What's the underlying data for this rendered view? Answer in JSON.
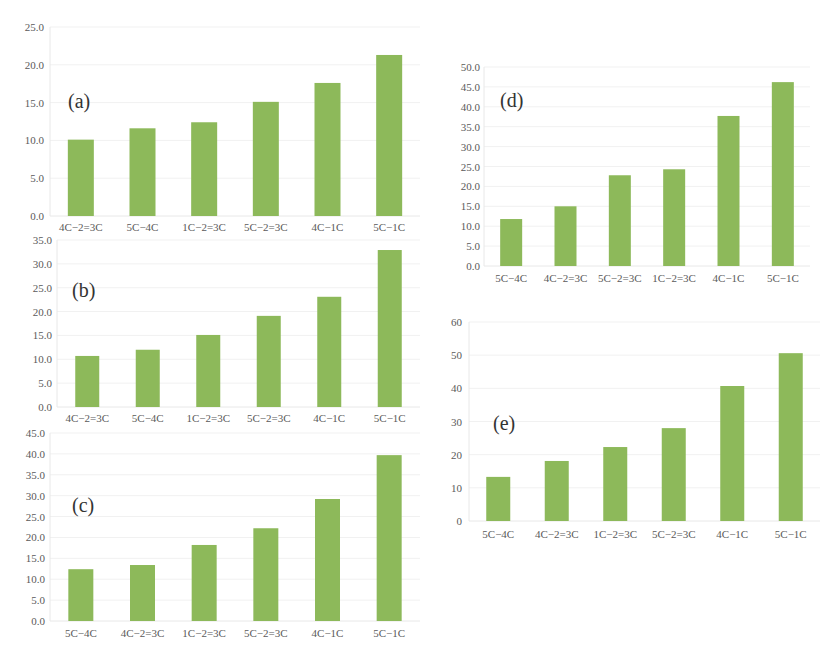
{
  "colors": {
    "bar": "#8db95a",
    "text": "#5a5a5a",
    "grid": "#f1f1f1"
  },
  "chart_data": [
    {
      "id": "a",
      "panel_label": "(a)",
      "type": "bar",
      "title": "",
      "xlabel": "",
      "ylabel": "",
      "categories": [
        "4C-2=3C",
        "5C-4C",
        "1C-2=3C",
        "5C-2=3C",
        "4C-1C",
        "5C-1C"
      ],
      "values": [
        10.1,
        11.6,
        12.4,
        15.1,
        17.6,
        21.3
      ],
      "ylim": [
        0,
        25
      ],
      "yticks": [
        "0.0",
        "5.0",
        "10.0",
        "15.0",
        "20.0",
        "25.0"
      ],
      "ytick_values": [
        0,
        5,
        10,
        15,
        20,
        25
      ],
      "grid": true,
      "legend": null
    },
    {
      "id": "b",
      "panel_label": "(b)",
      "type": "bar",
      "title": "",
      "xlabel": "",
      "ylabel": "",
      "categories": [
        "4C-2=3C",
        "5C-4C",
        "1C-2=3C",
        "5C-2=3C",
        "4C-1C",
        "5C-1C"
      ],
      "values": [
        10.7,
        12.0,
        15.1,
        19.1,
        23.1,
        32.9
      ],
      "ylim": [
        0,
        35
      ],
      "yticks": [
        "0.0",
        "5.0",
        "10.0",
        "15.0",
        "20.0",
        "25.0",
        "30.0",
        "35.0"
      ],
      "ytick_values": [
        0,
        5,
        10,
        15,
        20,
        25,
        30,
        35
      ],
      "grid": true,
      "legend": null
    },
    {
      "id": "c",
      "panel_label": "(c)",
      "type": "bar",
      "title": "",
      "xlabel": "",
      "ylabel": "",
      "categories": [
        "5C-4C",
        "4C-2=3C",
        "1C-2=3C",
        "5C-2=3C",
        "4C-1C",
        "5C-1C"
      ],
      "values": [
        12.4,
        13.4,
        18.2,
        22.2,
        29.2,
        39.7
      ],
      "ylim": [
        0,
        45
      ],
      "yticks": [
        "0.0",
        "5.0",
        "10.0",
        "15.0",
        "20.0",
        "25.0",
        "30.0",
        "35.0",
        "40.0",
        "45.0"
      ],
      "ytick_values": [
        0,
        5,
        10,
        15,
        20,
        25,
        30,
        35,
        40,
        45
      ],
      "grid": true,
      "legend": null
    },
    {
      "id": "d",
      "panel_label": "(d)",
      "type": "bar",
      "title": "",
      "xlabel": "",
      "ylabel": "",
      "categories": [
        "5C-4C",
        "4C-2=3C",
        "5C-2=3C",
        "1C-2=3C",
        "4C-1C",
        "5C-1C"
      ],
      "values": [
        11.8,
        15.0,
        22.8,
        24.3,
        37.7,
        46.2
      ],
      "ylim": [
        0,
        50
      ],
      "yticks": [
        "0.0",
        "5.0",
        "10.0",
        "15.0",
        "20.0",
        "25.0",
        "30.0",
        "35.0",
        "40.0",
        "45.0",
        "50.0"
      ],
      "ytick_values": [
        0,
        5,
        10,
        15,
        20,
        25,
        30,
        35,
        40,
        45,
        50
      ],
      "grid": true,
      "legend": null
    },
    {
      "id": "e",
      "panel_label": "(e)",
      "type": "bar",
      "title": "",
      "xlabel": "",
      "ylabel": "",
      "categories": [
        "5C-4C",
        "4C-2=3C",
        "1C-2=3C",
        "5C-2=3C",
        "4C-1C",
        "5C-1C"
      ],
      "values": [
        13.3,
        18.1,
        22.3,
        28.0,
        40.7,
        50.6
      ],
      "ylim": [
        0,
        60
      ],
      "yticks": [
        "0",
        "10",
        "20",
        "30",
        "40",
        "50",
        "60"
      ],
      "ytick_values": [
        0,
        10,
        20,
        30,
        40,
        50,
        60
      ],
      "grid": true,
      "legend": null
    }
  ]
}
